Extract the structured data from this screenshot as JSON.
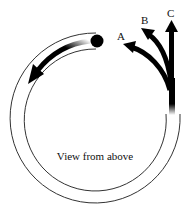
{
  "diagram": {
    "caption": "View from above",
    "arrow_labels": {
      "a": "A",
      "b": "B",
      "c": "C"
    },
    "elements": {
      "track": "circular track (view from above) with opening at upper right",
      "ball": "ball travelling counter-clockwise inside track",
      "motion_arrow": "arrow inside track showing ball direction",
      "exit_paths": [
        "A",
        "B",
        "C"
      ]
    },
    "colors": {
      "line": "#222222",
      "fill": "#000000",
      "background": "#ffffff"
    }
  }
}
